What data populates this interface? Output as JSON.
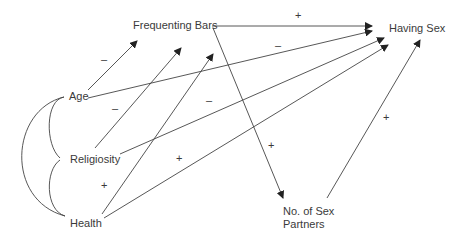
{
  "diagram": {
    "type": "path-diagram",
    "nodes": {
      "frequenting_bars": "Frequenting Bars",
      "having_sex": "Having Sex",
      "age": "Age",
      "religiosity": "Religiosity",
      "health": "Health",
      "partners_line1": "No. of Sex",
      "partners_line2": "Partners"
    },
    "signs": {
      "bars_to_sex": "+",
      "age_to_sex": "–",
      "age_to_bars": "–",
      "religiosity_to_bars": "–",
      "religiosity_to_sex": "–",
      "health_to_bars": "+",
      "health_to_sex": "+",
      "bars_to_partners": "+",
      "partners_to_sex": "+"
    },
    "edges": [
      {
        "from": "Frequenting Bars",
        "to": "Having Sex",
        "sign": "+"
      },
      {
        "from": "Age",
        "to": "Having Sex",
        "sign": "–"
      },
      {
        "from": "Age",
        "to": "Frequenting Bars",
        "sign": "–"
      },
      {
        "from": "Religiosity",
        "to": "Frequenting Bars",
        "sign": "–"
      },
      {
        "from": "Religiosity",
        "to": "Having Sex",
        "sign": "–"
      },
      {
        "from": "Health",
        "to": "Frequenting Bars",
        "sign": "+"
      },
      {
        "from": "Health",
        "to": "Having Sex",
        "sign": "+"
      },
      {
        "from": "Frequenting Bars",
        "to": "No. of Sex Partners",
        "sign": "+"
      },
      {
        "from": "No. of Sex Partners",
        "to": "Having Sex",
        "sign": "+"
      }
    ],
    "correlations": [
      {
        "between": [
          "Age",
          "Religiosity"
        ]
      },
      {
        "between": [
          "Religiosity",
          "Health"
        ]
      },
      {
        "between": [
          "Age",
          "Health"
        ]
      }
    ]
  }
}
